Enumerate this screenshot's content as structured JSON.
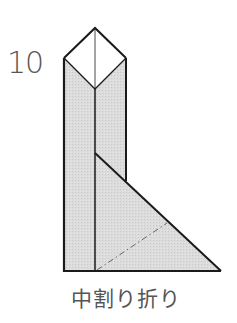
{
  "step": {
    "number": "10"
  },
  "caption": {
    "text": "中割り折り"
  },
  "diagram": {
    "fill_color": "#d9d9d9",
    "paper_white": "#ffffff",
    "line_color": "#1a1a1a",
    "fold_line_color": "#666666",
    "fold_line_style": "dash-dot"
  }
}
